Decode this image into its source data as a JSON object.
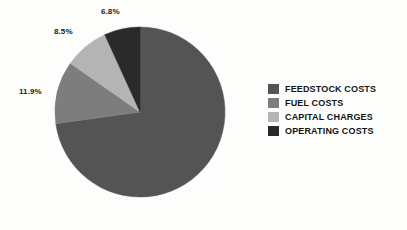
{
  "chart_data": {
    "type": "pie",
    "title": "",
    "categories": [
      "FEEDSTOCK COSTS",
      "FUEL COSTS",
      "CAPITAL CHARGES",
      "OPERATING COSTS"
    ],
    "values": [
      72.8,
      11.9,
      8.5,
      6.8
    ],
    "value_labels": [
      "72.8%",
      "11.9%",
      "8.5%",
      "6.8%"
    ],
    "colors": [
      "#545454",
      "#7d7d7d",
      "#b4b4b4",
      "#2a2a2a"
    ],
    "units": "percent",
    "start_angle_deg": 0,
    "direction": "clockwise",
    "legend_position": "right",
    "grid": false,
    "label_placement": [
      "inside",
      "outside",
      "outside",
      "outside"
    ]
  },
  "legend": {
    "items": [
      {
        "label": "FEEDSTOCK COSTS",
        "color": "#545454"
      },
      {
        "label": "FUEL COSTS",
        "color": "#7d7d7d"
      },
      {
        "label": "CAPITAL CHARGES",
        "color": "#b4b4b4"
      },
      {
        "label": "OPERATING COSTS",
        "color": "#2a2a2a"
      }
    ]
  },
  "labels": {
    "feedstock": "72.8%",
    "fuel": "11.9%",
    "capital": "8.5%",
    "operating": "6.8%"
  }
}
